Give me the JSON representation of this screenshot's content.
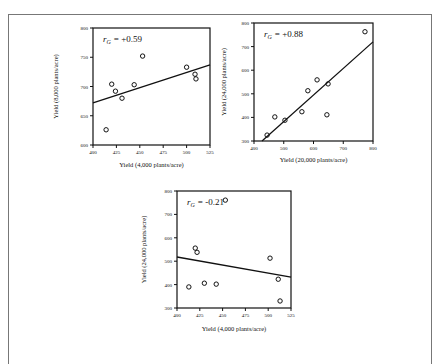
{
  "chart_data": [
    {
      "type": "scatter",
      "title": "",
      "annotation": "r_G = +0.59",
      "annotation_sym": "r",
      "annotation_sub": "G",
      "annotation_val": "=  +0.59",
      "xlabel": "Yield  (4,000 plants/acre)",
      "ylabel": "Yield  (8,000 plants/acre)",
      "xlim": [
        400,
        525
      ],
      "ylim": [
        600,
        800
      ],
      "xticks": [
        400,
        425,
        450,
        475,
        500,
        525
      ],
      "yticks": [
        600,
        650,
        700,
        750,
        800
      ],
      "grid": false,
      "points": [
        [
          414,
          626
        ],
        [
          420,
          704
        ],
        [
          424,
          692
        ],
        [
          431,
          680
        ],
        [
          444,
          703
        ],
        [
          453,
          752
        ],
        [
          500,
          733
        ],
        [
          509,
          721
        ],
        [
          510,
          713
        ]
      ],
      "fit_line": [
        [
          400,
          672
        ],
        [
          525,
          737
        ]
      ]
    },
    {
      "type": "scatter",
      "title": "",
      "annotation": "r_G = +0.88",
      "annotation_sym": "r",
      "annotation_sub": "G",
      "annotation_val": "=  +0.88",
      "xlabel": "Yield  (20,000 plants/acre)",
      "ylabel": "Yield  (24,000 plants/acre)",
      "xlim": [
        400,
        800
      ],
      "ylim": [
        300,
        800
      ],
      "xticks": [
        400,
        500,
        600,
        700,
        800
      ],
      "yticks": [
        300,
        400,
        500,
        600,
        700,
        800
      ],
      "grid": false,
      "points": [
        [
          444,
          325
        ],
        [
          470,
          402
        ],
        [
          504,
          388
        ],
        [
          561,
          424
        ],
        [
          581,
          513
        ],
        [
          612,
          559
        ],
        [
          649,
          542
        ],
        [
          645,
          411
        ],
        [
          773,
          763
        ]
      ],
      "fit_line": [
        [
          427,
          300
        ],
        [
          800,
          720
        ]
      ]
    },
    {
      "type": "scatter",
      "title": "",
      "annotation": "r_G = -0.21",
      "annotation_sym": "r",
      "annotation_sub": "G",
      "annotation_val": "= -0.21",
      "xlabel": "Yield  (4,000 plants/acre)",
      "ylabel": "Yield  (24,000 plants/acre)",
      "xlim": [
        400,
        525
      ],
      "ylim": [
        300,
        800
      ],
      "xticks": [
        400,
        425,
        450,
        475,
        500,
        525
      ],
      "yticks": [
        300,
        400,
        500,
        600,
        700,
        800
      ],
      "grid": false,
      "points": [
        [
          413,
          390
        ],
        [
          420,
          556
        ],
        [
          422,
          538
        ],
        [
          430,
          406
        ],
        [
          443,
          402
        ],
        [
          453,
          761
        ],
        [
          502,
          513
        ],
        [
          511,
          423
        ],
        [
          513,
          330
        ]
      ],
      "fit_line": [
        [
          400,
          518
        ],
        [
          525,
          432
        ]
      ]
    }
  ],
  "layout": [
    {
      "left": 93,
      "top": 28,
      "width": 117,
      "height": 117,
      "ylabel_x": 58,
      "xlabel_y": 167
    },
    {
      "left": 254,
      "top": 23,
      "width": 119,
      "height": 118,
      "ylabel_x": 226,
      "xlabel_y": 162
    },
    {
      "left": 177,
      "top": 191,
      "width": 114,
      "height": 117,
      "ylabel_x": 146,
      "xlabel_y": 331
    }
  ]
}
